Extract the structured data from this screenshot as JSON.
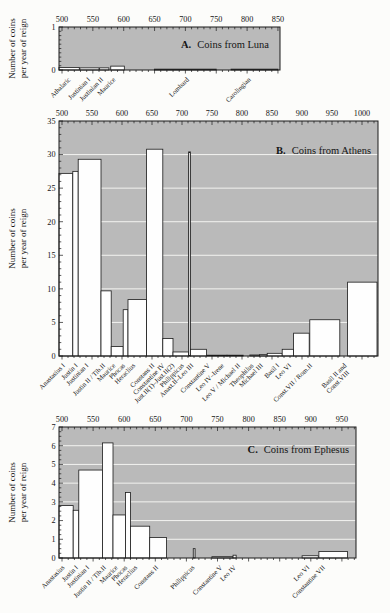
{
  "colors": {
    "plot_bg": "#bababa",
    "bar_fill": "#fefefe",
    "narrow_bar_fill": "#d6d6d6",
    "grid": "#f3f3f0",
    "axis": "#1a1a1a"
  },
  "chart_data": [
    {
      "type": "bar",
      "panel": "A.",
      "title": "Coins from Luna",
      "ylabel": "Number of coins per year of reign",
      "ylabel_lines": [
        "Number of coins",
        "per year of reign"
      ],
      "x_axis": {
        "tick_start": 500,
        "tick_end": 850,
        "tick_step": 50,
        "minor_step": 10
      },
      "y_axis": {
        "max": 1,
        "tick_step": 1,
        "minor_step": 0.1,
        "grid_step": 0
      },
      "bars": [
        {
          "label": "Athalaric",
          "start": 495,
          "end": 528,
          "value": 0.06,
          "label_year": 508
        },
        {
          "label": "Justinian I",
          "start": 529,
          "end": 560,
          "value": 0.05,
          "label_year": 540
        },
        {
          "label": "Justinian II",
          "start": 561,
          "end": 576,
          "value": 0.05,
          "label_year": 561
        },
        {
          "label": "Maurice",
          "start": 579,
          "end": 601,
          "value": 0.09,
          "label_year": 581
        },
        {
          "label": "Lombard",
          "start": 650,
          "end": 750,
          "value": 0.02,
          "label_year": 700
        },
        {
          "label": "Carolingian",
          "start": 774,
          "end": 850,
          "value": 0.02,
          "label_year": 800
        }
      ]
    },
    {
      "type": "bar",
      "panel": "B.",
      "title": "Coins from Athens",
      "ylabel": "Number of coins per year of reign",
      "ylabel_lines": [
        "Number of coins",
        "per year of reign"
      ],
      "x_axis": {
        "tick_start": 500,
        "tick_end": 1000,
        "tick_step": 50,
        "minor_step": 10
      },
      "y_axis": {
        "max": 35,
        "tick_step": 5,
        "minor_step": 1,
        "grid_step": 5
      },
      "bars": [
        {
          "label": "Anastasius I",
          "start": 495,
          "end": 518,
          "value": 27.2,
          "label_year": 499
        },
        {
          "label": "Justin I",
          "start": 518,
          "end": 527,
          "value": 27.5,
          "label_year": 520
        },
        {
          "label": "Justinian I",
          "start": 527,
          "end": 565,
          "value": 29.3,
          "label_year": 538
        },
        {
          "label": "Justin II / Tib.II",
          "start": 565,
          "end": 582,
          "value": 9.7,
          "label_year": 566
        },
        {
          "label": "Maurice",
          "start": 582,
          "end": 602,
          "value": 1.4,
          "label_year": 583
        },
        {
          "label": "Phocas",
          "start": 602,
          "end": 610,
          "value": 6.9,
          "label_year": 599
        },
        {
          "label": "Heraclius",
          "start": 610,
          "end": 641,
          "value": 8.4,
          "label_year": 616
        },
        {
          "label": "Constans II",
          "start": 641,
          "end": 668,
          "value": 30.8,
          "label_year": 648
        },
        {
          "label": "Constantine IV",
          "start": 668,
          "end": 685,
          "value": 2.6,
          "label_year": 665
        },
        {
          "label": "Just.II(1)–Just.II(2)",
          "start": 685,
          "end": 711,
          "value": 0.6,
          "label_year": 681,
          "narrow": false
        },
        {
          "label": "Philippicus",
          "start": 711,
          "end": 714,
          "value": 30.4,
          "label_year": 697,
          "narrow": true
        },
        {
          "label": "Anast.II–Leo III",
          "start": 714,
          "end": 741,
          "value": 1.0,
          "label_year": 713
        },
        {
          "label": "Constantine V",
          "start": 741,
          "end": 775,
          "value": 0.12,
          "label_year": 741
        },
        {
          "label": "Leo IV–Irene",
          "start": 775,
          "end": 802,
          "value": 0.12,
          "label_year": 764
        },
        {
          "label": "Leo V / Michael II",
          "start": 813,
          "end": 829,
          "value": 0.15,
          "label_year": 791
        },
        {
          "label": "Theophilus",
          "start": 829,
          "end": 842,
          "value": 0.2,
          "label_year": 813
        },
        {
          "label": "Michael III",
          "start": 842,
          "end": 867,
          "value": 0.4,
          "label_year": 829
        },
        {
          "label": "Basil I",
          "start": 867,
          "end": 886,
          "value": 1.0,
          "label_year": 856
        },
        {
          "label": "Leo VI",
          "start": 886,
          "end": 912,
          "value": 3.4,
          "label_year": 876
        },
        {
          "label": "Const.VII / Rom.II",
          "start": 913,
          "end": 963,
          "value": 5.4,
          "label_year": 911
        },
        {
          "label": "Basil II and\nConst.VIII",
          "start": 976,
          "end": 1025,
          "value": 11.0,
          "label_year": 968
        }
      ]
    },
    {
      "type": "bar",
      "panel": "C.",
      "title": "Coins from Ephesus",
      "ylabel": "Number of coins per year of reign",
      "ylabel_lines": [
        "Number of coins",
        "per year of reign"
      ],
      "x_axis": {
        "tick_start": 500,
        "tick_end": 950,
        "tick_step": 50,
        "minor_step": 10
      },
      "y_axis": {
        "max": 7,
        "tick_step": 1,
        "minor_step": 0.25,
        "grid_step": 1
      },
      "bars": [
        {
          "label": "Anastasius",
          "start": 495,
          "end": 518,
          "value": 2.8,
          "label_year": 498
        },
        {
          "label": "Justin I",
          "start": 518,
          "end": 527,
          "value": 2.55,
          "label_year": 520
        },
        {
          "label": "Justinian I",
          "start": 527,
          "end": 565,
          "value": 4.7,
          "label_year": 538
        },
        {
          "label": "Justin II / Tib.II",
          "start": 565,
          "end": 582,
          "value": 6.15,
          "label_year": 565
        },
        {
          "label": "Maurice",
          "start": 582,
          "end": 602,
          "value": 2.3,
          "label_year": 584
        },
        {
          "label": "Phocas",
          "start": 602,
          "end": 610,
          "value": 3.5,
          "label_year": 599
        },
        {
          "label": "Heraclius",
          "start": 610,
          "end": 641,
          "value": 1.7,
          "label_year": 615
        },
        {
          "label": "Constans II",
          "start": 641,
          "end": 668,
          "value": 1.1,
          "label_year": 649
        },
        {
          "label": "Philippicus",
          "start": 711,
          "end": 714,
          "value": 0.5,
          "label_year": 707,
          "narrow": true
        },
        {
          "label": "Constantine V",
          "start": 741,
          "end": 775,
          "value": 0.07,
          "label_year": 752
        },
        {
          "label": "Leo IV",
          "start": 775,
          "end": 780,
          "value": 0.15,
          "label_year": 774
        },
        {
          "label": "Leo VI",
          "start": 886,
          "end": 912,
          "value": 0.12,
          "label_year": 892
        },
        {
          "label": "Constantine VII",
          "start": 913,
          "end": 959,
          "value": 0.35,
          "label_year": 917
        }
      ]
    }
  ]
}
